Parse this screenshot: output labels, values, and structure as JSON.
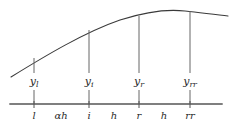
{
  "figure": {
    "title": "",
    "colors": {
      "curve": "#3a3a3a",
      "axis": "#555555",
      "ordinate": "#666666",
      "tick": "#555555",
      "text": "#2b2b2b",
      "background": "#ffffff"
    },
    "curve": {
      "name": "interpolated-curve",
      "path": "M 11 77 C 45 56, 85 32, 120 20 C 148 11, 168 9, 185 11 C 203 13, 217 15, 228 16"
    },
    "axis": {
      "name": "horizontal-axis",
      "y": 104,
      "x_start": 10,
      "x_end": 222
    },
    "ordinates": [
      {
        "x": 34,
        "y_top": 58,
        "label_main": "y",
        "label_sub": "l",
        "axis_label": "l"
      },
      {
        "x": 89,
        "y_top": 30,
        "label_main": "y",
        "label_sub": "i",
        "axis_label": "i"
      },
      {
        "x": 139,
        "y_top": 16,
        "label_main": "y",
        "label_sub": "r",
        "axis_label": "r"
      },
      {
        "x": 190,
        "y_top": 11,
        "label_main": "y",
        "label_sub": "rr",
        "axis_label": "rr"
      }
    ],
    "intervals": [
      {
        "x": 61,
        "label": "αh"
      },
      {
        "x": 114,
        "label": "h"
      },
      {
        "x": 164,
        "label": "h"
      }
    ]
  }
}
